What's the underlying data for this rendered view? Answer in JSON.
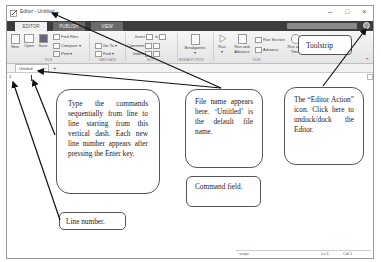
{
  "window": {
    "title": "Editor - Untitled",
    "controls": {
      "minimize": "–",
      "maximize": "□",
      "close": "×"
    }
  },
  "ribbon_tabs": [
    {
      "label": "EDITOR",
      "active": true
    },
    {
      "label": "PUBLISH",
      "active": false
    },
    {
      "label": "VIEW",
      "active": false
    }
  ],
  "ribbon": {
    "file": {
      "new": "New",
      "open": "Open",
      "save": "Save",
      "find_files": "Find Files",
      "compare": "Compare",
      "print": "Print",
      "group": "FILE"
    },
    "navigate": {
      "go_to": "Go To",
      "find": "Find",
      "group": "NAVIGATE"
    },
    "edit": {
      "insert": "Insert",
      "comment": "Comment",
      "indent": "Indent",
      "group": "EDIT"
    },
    "breakpoints": {
      "label": "Breakpoints",
      "group": "BREAKPOINTS"
    },
    "run": {
      "run": "Run",
      "run_and_advance": "Run and Advance",
      "run_section": "Run Section",
      "advance": "Advance",
      "run_and_time": "Run and Time",
      "group": "RUN"
    }
  },
  "document": {
    "tab_label": "Untitled",
    "add_tab": "+",
    "line_number": "1"
  },
  "status_bar": {
    "type": "script",
    "line": "Ln  1",
    "col": "Col  1"
  },
  "annotations": {
    "toolstrip": "Toolstrip",
    "type_commands": "Type the commands sequentially from line to line starting from this vertical dash. Each new line number appears after pressing the Enter key.",
    "file_name": "File name appears here. ‘Untitled’ is the default file name.",
    "editor_action": "The “Editor Action” icon. Click here to undock/dock the Editor.",
    "command_field": "Command field.",
    "line_number": "Line number."
  }
}
